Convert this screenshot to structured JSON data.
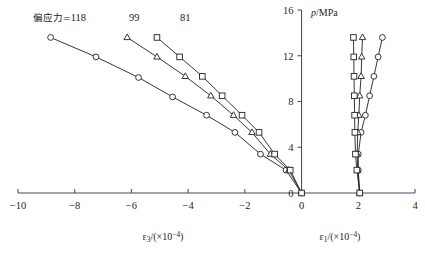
{
  "chart_data": {
    "type": "line",
    "title": "",
    "xlabel_left": "ε₃/(×10⁻⁴)",
    "xlabel_right": "ε₁/(×10⁻⁴)",
    "ylabel": "p/MPa",
    "xlim": [
      -10,
      4
    ],
    "ylim": [
      0,
      16
    ],
    "xticks": [
      -10,
      -8,
      -6,
      -4,
      -2,
      0,
      2,
      4
    ],
    "xticklabels": [
      "−10",
      "−8",
      "−6",
      "−4",
      "−2",
      "0",
      "2",
      "4"
    ],
    "yticks": [
      0,
      4,
      8,
      12,
      16
    ],
    "yticklabels": [
      "0",
      "4",
      "8",
      "12",
      "16"
    ],
    "grid": false,
    "legend_position": "inline-top",
    "annotations": [
      {
        "name": "series-label-118",
        "text_prefix": "偏应力=",
        "text": "偏应力=118",
        "value": "118",
        "x": -9.2,
        "y": 15.0
      },
      {
        "name": "series-label-99",
        "text": "99",
        "value": "99",
        "x": -5.9,
        "y": 15.0
      },
      {
        "name": "series-label-81",
        "text": "81",
        "value": "81",
        "x": -4.1,
        "y": 15.0
      }
    ],
    "series": [
      {
        "name": "deviator-stress-118-lateral",
        "label": "118",
        "marker": "circle",
        "branch": "lateral",
        "points": [
          {
            "x": 0.0,
            "y": 0.0
          },
          {
            "x": -0.55,
            "y": 2.0
          },
          {
            "x": -1.45,
            "y": 3.4
          },
          {
            "x": -2.35,
            "y": 5.3
          },
          {
            "x": -3.35,
            "y": 6.8
          },
          {
            "x": -4.55,
            "y": 8.4
          },
          {
            "x": -5.75,
            "y": 10.1
          },
          {
            "x": -7.25,
            "y": 11.9
          },
          {
            "x": -8.85,
            "y": 13.6
          }
        ]
      },
      {
        "name": "deviator-stress-99-lateral",
        "label": "99",
        "marker": "triangle",
        "branch": "lateral",
        "points": [
          {
            "x": 0.0,
            "y": 0.0
          },
          {
            "x": -0.45,
            "y": 2.0
          },
          {
            "x": -1.1,
            "y": 3.4
          },
          {
            "x": -1.75,
            "y": 5.3
          },
          {
            "x": -2.4,
            "y": 6.8
          },
          {
            "x": -3.2,
            "y": 8.5
          },
          {
            "x": -4.1,
            "y": 10.2
          },
          {
            "x": -5.1,
            "y": 11.9
          },
          {
            "x": -6.15,
            "y": 13.6
          }
        ]
      },
      {
        "name": "deviator-stress-81-lateral",
        "label": "81",
        "marker": "square",
        "branch": "lateral",
        "points": [
          {
            "x": 0.0,
            "y": 0.0
          },
          {
            "x": -0.4,
            "y": 2.0
          },
          {
            "x": -0.95,
            "y": 3.4
          },
          {
            "x": -1.5,
            "y": 5.3
          },
          {
            "x": -2.1,
            "y": 6.8
          },
          {
            "x": -2.8,
            "y": 8.5
          },
          {
            "x": -3.5,
            "y": 10.2
          },
          {
            "x": -4.3,
            "y": 11.9
          },
          {
            "x": -5.1,
            "y": 13.6
          }
        ]
      },
      {
        "name": "deviator-stress-118-axial",
        "label": "118",
        "marker": "circle",
        "branch": "axial",
        "points": [
          {
            "x": 2.05,
            "y": 0.0
          },
          {
            "x": 2.0,
            "y": 2.0
          },
          {
            "x": 2.0,
            "y": 3.4
          },
          {
            "x": 2.1,
            "y": 5.3
          },
          {
            "x": 2.25,
            "y": 6.8
          },
          {
            "x": 2.4,
            "y": 8.5
          },
          {
            "x": 2.55,
            "y": 10.2
          },
          {
            "x": 2.7,
            "y": 11.9
          },
          {
            "x": 2.85,
            "y": 13.6
          }
        ]
      },
      {
        "name": "deviator-stress-99-axial",
        "label": "99",
        "marker": "triangle",
        "branch": "axial",
        "points": [
          {
            "x": 2.05,
            "y": 0.0
          },
          {
            "x": 1.98,
            "y": 2.0
          },
          {
            "x": 1.96,
            "y": 3.4
          },
          {
            "x": 1.98,
            "y": 5.3
          },
          {
            "x": 2.02,
            "y": 6.8
          },
          {
            "x": 2.05,
            "y": 8.5
          },
          {
            "x": 2.1,
            "y": 10.2
          },
          {
            "x": 2.12,
            "y": 11.9
          },
          {
            "x": 2.15,
            "y": 13.6
          }
        ]
      },
      {
        "name": "deviator-stress-81-axial",
        "label": "81",
        "marker": "square",
        "branch": "axial",
        "points": [
          {
            "x": 2.05,
            "y": 0.0
          },
          {
            "x": 1.95,
            "y": 2.0
          },
          {
            "x": 1.9,
            "y": 3.4
          },
          {
            "x": 1.88,
            "y": 5.3
          },
          {
            "x": 1.87,
            "y": 6.8
          },
          {
            "x": 1.86,
            "y": 8.5
          },
          {
            "x": 1.85,
            "y": 10.2
          },
          {
            "x": 1.84,
            "y": 11.9
          },
          {
            "x": 1.83,
            "y": 13.6
          }
        ]
      }
    ]
  }
}
